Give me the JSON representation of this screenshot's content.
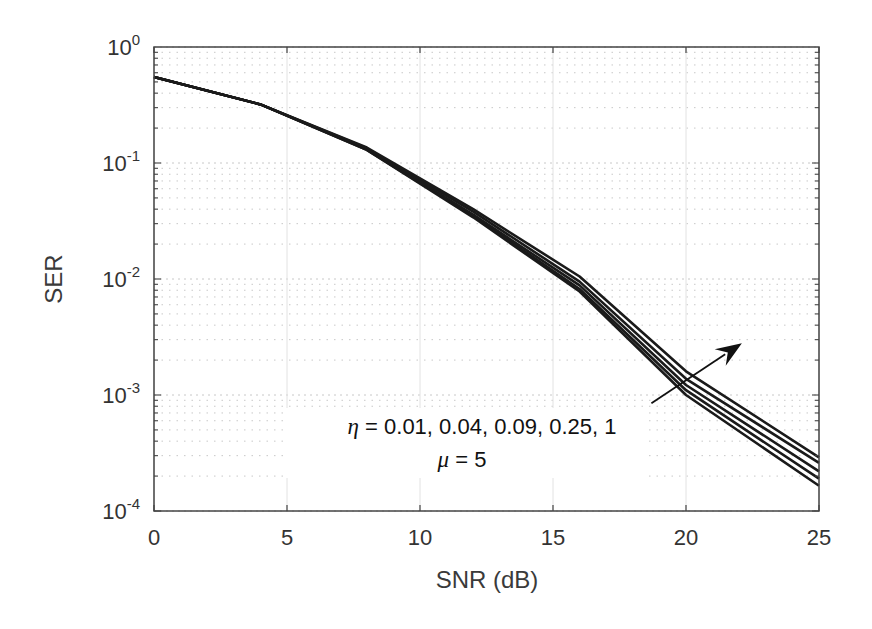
{
  "chart_data": {
    "type": "line",
    "title": "",
    "xlabel": "SNR (dB)",
    "ylabel": "SER",
    "xlim": [
      0,
      25
    ],
    "ylim": [
      0.0001,
      1
    ],
    "yscale": "log",
    "grid": true,
    "x_ticks": [
      0,
      5,
      10,
      15,
      20,
      25
    ],
    "y_ticks": [
      {
        "value": 1,
        "base": "10",
        "exp": "0"
      },
      {
        "value": 0.1,
        "base": "10",
        "exp": "-1"
      },
      {
        "value": 0.01,
        "base": "10",
        "exp": "-2"
      },
      {
        "value": 0.001,
        "base": "10",
        "exp": "-3"
      },
      {
        "value": 0.0001,
        "base": "10",
        "exp": "-4"
      }
    ],
    "x": [
      0,
      4,
      8,
      12,
      16,
      20,
      25
    ],
    "series": [
      {
        "name": "eta = 0.01",
        "values": [
          0.55,
          0.32,
          0.13,
          0.034,
          0.0078,
          0.001,
          0.000165
        ]
      },
      {
        "name": "eta = 0.04",
        "values": [
          0.55,
          0.32,
          0.13,
          0.035,
          0.0082,
          0.0011,
          0.00019
        ]
      },
      {
        "name": "eta = 0.09",
        "values": [
          0.55,
          0.32,
          0.132,
          0.036,
          0.0088,
          0.00122,
          0.00022
        ]
      },
      {
        "name": "eta = 0.25",
        "values": [
          0.55,
          0.32,
          0.134,
          0.038,
          0.0095,
          0.00138,
          0.00026
        ]
      },
      {
        "name": "eta = 1",
        "values": [
          0.55,
          0.32,
          0.136,
          0.04,
          0.0105,
          0.0016,
          0.00029
        ]
      }
    ],
    "annotations": [
      {
        "text_symbol": "η",
        "text_rest": " = 0.01, 0.04, 0.09, 0.25, 1"
      },
      {
        "text_symbol": "μ",
        "text_rest": " = 5"
      }
    ],
    "arrow": {
      "from": [
        18.7,
        0.00085
      ],
      "to": [
        22.1,
        0.0028
      ],
      "meaning": "increasing eta"
    },
    "legend": "none"
  },
  "labels": {
    "xlabel": "SNR (dB)",
    "ylabel": "SER",
    "annot1_sym": "η",
    "annot1_rest": " = 0.01, 0.04, 0.09, 0.25, 1",
    "annot2_sym": "μ",
    "annot2_rest": " = 5"
  },
  "colors": {
    "line": "#1a1a1a",
    "axis": "#444444",
    "grid": "#c8c8c8",
    "text": "#333333"
  }
}
